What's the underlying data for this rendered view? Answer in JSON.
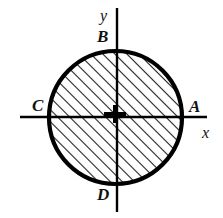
{
  "figure": {
    "background_color": "#ffffff",
    "stroke_color": "#000000",
    "hatch_color": "#1a1a1a",
    "width": 223,
    "height": 218,
    "circle": {
      "center_x": 115.5,
      "center_y": 117.5,
      "radius": 67,
      "outline_width": 4,
      "fill": "diagonal-hatch",
      "hatch_angle_deg": 45,
      "hatch_spacing": 6,
      "hatch_line_width": 1.6
    },
    "axes": {
      "x_axis": {
        "x1": 20,
        "y1": 117,
        "x2": 207,
        "y2": 117,
        "width": 2.4
      },
      "y_axis": {
        "x1": 117,
        "y1": 8,
        "x2": 117,
        "y2": 212,
        "width": 2.4
      }
    },
    "center_marker": {
      "type": "plus",
      "center_x": 115,
      "center_y": 114,
      "half_width": 11,
      "half_height": 9,
      "thickness": 4
    },
    "labels": {
      "point_a": "A",
      "point_b": "B",
      "point_c": "C",
      "point_d": "D",
      "axis_x": "x",
      "axis_y": "y"
    }
  }
}
